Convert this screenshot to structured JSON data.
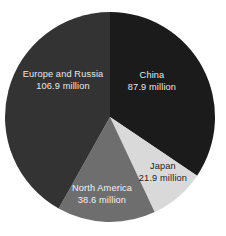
{
  "figure": {
    "background_color": "#ffffff",
    "title": ""
  },
  "geometry": {
    "center_x": 110,
    "center_y": 117,
    "radius": 105,
    "start_angle_deg": 0,
    "direction": "clockwise"
  },
  "chart_data": {
    "type": "pie",
    "title": "",
    "unit": "million",
    "total": 255.3,
    "total_label": "255.3 million",
    "categories": [
      "China",
      "Japan",
      "North America",
      "Europe and Russia"
    ],
    "values": [
      87.9,
      21.9,
      38.6,
      106.9
    ],
    "legend": "none",
    "grid": false,
    "slices": [
      {
        "name": "China",
        "label": "China",
        "value": 87.9,
        "value_label": "87.9 million",
        "percent": 34.4,
        "start_angle_deg": 0,
        "end_angle_deg": 123.95,
        "color": "#1b1b1b",
        "label_color": "#e9e9e9",
        "label_tone": "on-dark",
        "label_x": 152,
        "label_y": 76,
        "value_x": 152,
        "value_y": 88
      },
      {
        "name": "Japan",
        "label": "Japan",
        "value": 21.9,
        "value_label": "21.9 million",
        "percent": 8.6,
        "start_angle_deg": 123.95,
        "end_angle_deg": 154.83,
        "color": "#d9d9d9",
        "label_color": "#1c1c1c",
        "label_tone": "on-light",
        "label_x": 163,
        "label_y": 167,
        "value_x": 163,
        "value_y": 179
      },
      {
        "name": "North America",
        "label": "North America",
        "value": 38.6,
        "value_label": "38.6 million",
        "percent": 15.1,
        "start_angle_deg": 154.83,
        "end_angle_deg": 209.26,
        "color": "#6e6e6e",
        "label_color": "#f2f2f2",
        "label_tone": "on-mid",
        "label_x": 102,
        "label_y": 189,
        "value_x": 102,
        "value_y": 201
      },
      {
        "name": "Europe and Russia",
        "label": "Europe and Russia",
        "value": 106.9,
        "value_label": "106.9 million",
        "percent": 41.9,
        "start_angle_deg": 209.26,
        "end_angle_deg": 360,
        "color": "#333333",
        "label_color": "#e9e9e9",
        "label_tone": "on-dark",
        "label_x": 63,
        "label_y": 75,
        "value_x": 63,
        "value_y": 87
      }
    ]
  }
}
